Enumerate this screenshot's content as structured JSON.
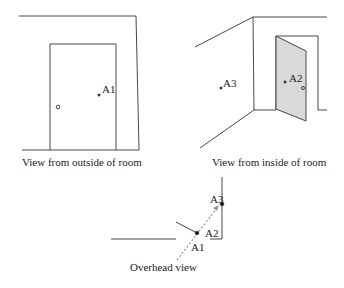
{
  "panels": {
    "outside": {
      "caption": "View from outside of room",
      "points": [
        {
          "label": "A1"
        }
      ]
    },
    "inside": {
      "caption": "View from inside of room",
      "points": [
        {
          "label": "A2"
        },
        {
          "label": "A3"
        }
      ]
    },
    "overhead": {
      "caption": "Overhead view",
      "points": [
        {
          "label": "A1"
        },
        {
          "label": "A2"
        },
        {
          "label": "A3"
        }
      ]
    }
  },
  "colors": {
    "line": "#333333",
    "door_fill": "#d9d9d9",
    "arrow": "#9a9a9a"
  }
}
